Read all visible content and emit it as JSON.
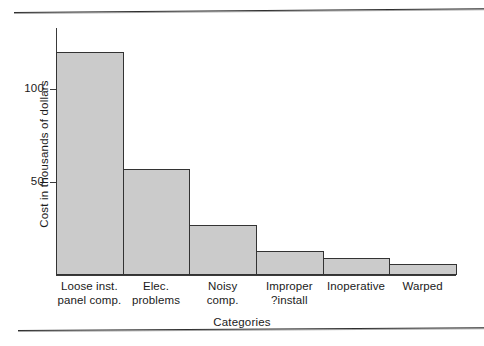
{
  "figure": {
    "background_color": "#ffffff",
    "axis_color": "#3a3a3a",
    "bar_fill_color": "#cbcbcb",
    "bar_edge_color": "#333333"
  },
  "chart_data": {
    "type": "bar",
    "title": "",
    "xlabel": "Categories",
    "ylabel": "Cost in thousands of dollars",
    "categories": [
      "Loose inst. panel comp.",
      "Elec. problems",
      "Noisy comp.",
      "Improper ?install",
      "Inoperative",
      "Warped"
    ],
    "category_lines": [
      [
        "Loose inst.",
        "panel comp."
      ],
      [
        "Elec.",
        "problems"
      ],
      [
        "Noisy",
        "comp."
      ],
      [
        "Improper",
        "?install"
      ],
      [
        "Inoperative",
        ""
      ],
      [
        "Warped",
        ""
      ]
    ],
    "values": [
      120,
      57,
      27,
      13,
      9,
      6
    ],
    "ylim": [
      0,
      133
    ],
    "xlim": [
      0,
      6
    ],
    "yticks": [
      50,
      100
    ],
    "ytick_labels": [
      "50",
      "100"
    ],
    "grid": false,
    "legend": null,
    "bars_contiguous": true
  }
}
